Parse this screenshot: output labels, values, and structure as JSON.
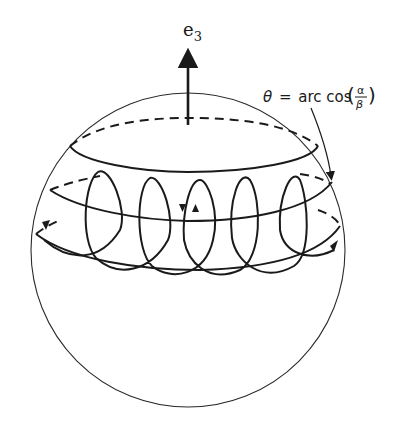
{
  "figure": {
    "axis_label": "e",
    "axis_subscript": "3",
    "angle_annotation": {
      "theta": "θ",
      "equals": "=",
      "function": "arc cos",
      "numerator": "α",
      "denominator": "β"
    }
  },
  "colors": {
    "line": "#1a1a1a",
    "background": "#ffffff"
  }
}
